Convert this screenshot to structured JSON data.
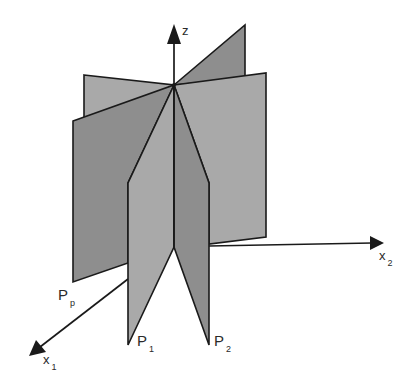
{
  "figure": {
    "colors": {
      "background": "#ffffff",
      "light_plane": "#a9a9a9",
      "dark_plane": "#8e8e8e",
      "stroke": "#1a1a1a",
      "text": "#2a2a2a"
    },
    "axes": {
      "z": {
        "name": "z",
        "subscript": ""
      },
      "x1": {
        "name": "x",
        "subscript": "1"
      },
      "x2": {
        "name": "x",
        "subscript": "2"
      }
    },
    "planes": [
      {
        "name": "P",
        "subscript": "1"
      },
      {
        "name": "P",
        "subscript": "2"
      },
      {
        "name": "P",
        "subscript": "p"
      }
    ]
  }
}
